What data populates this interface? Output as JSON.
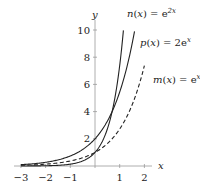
{
  "chart_data": {
    "type": "line",
    "title": "",
    "xlabel": "x",
    "ylabel": "y",
    "xlim": [
      -3.1,
      2.3
    ],
    "ylim": [
      0,
      10.5
    ],
    "x_ticks": [
      -3,
      -2,
      -1,
      1,
      2
    ],
    "x_tick_labels": [
      "−3",
      "−2",
      "−1",
      "1",
      "2"
    ],
    "y_ticks": [
      2,
      4,
      6,
      8,
      10
    ],
    "y_tick_labels": [
      "2",
      "4",
      "6",
      "8",
      "10"
    ],
    "grid": false,
    "series": [
      {
        "name": "n(x) = e^{2x}",
        "label_main": "n(x) = e",
        "label_exp": "2x",
        "style": "solid",
        "formula": "exp(2x)",
        "x": [
          -3,
          -2,
          -1,
          0,
          0.5,
          1,
          1.15
        ],
        "values": [
          0.0025,
          0.018,
          0.135,
          1,
          2.72,
          7.39,
          9.97
        ]
      },
      {
        "name": "p(x) = 2e^x",
        "label_main": "p(x) = 2e",
        "label_exp": "x",
        "style": "solid",
        "formula": "2*exp(x)",
        "x": [
          -3,
          -2,
          -1,
          0,
          0.5,
          1,
          1.6
        ],
        "values": [
          0.1,
          0.27,
          0.74,
          2,
          3.3,
          5.44,
          9.9
        ]
      },
      {
        "name": "m(x) = e^x",
        "label_main": "m(x) = e",
        "label_exp": "x",
        "style": "dashed",
        "formula": "exp(x)",
        "x": [
          -3,
          -2,
          -1,
          0,
          1,
          2
        ],
        "values": [
          0.05,
          0.135,
          0.37,
          1,
          2.72,
          7.39
        ]
      }
    ]
  }
}
